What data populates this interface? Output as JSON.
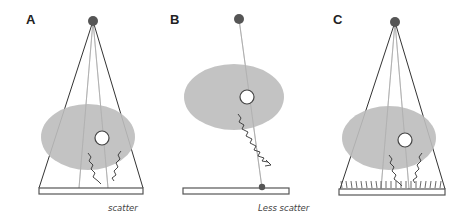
{
  "panels": [
    {
      "label": "A",
      "caption": "scatter"
    },
    {
      "label": "B",
      "caption": "Less scatter"
    },
    {
      "label": "C",
      "caption": ""
    }
  ],
  "colors": {
    "source": "#555555",
    "beam_edge": "#333333",
    "beam_ray": "#aaaaaa",
    "patient": "#bdbdbd",
    "detector": "#555555",
    "scatter": "#333333"
  }
}
